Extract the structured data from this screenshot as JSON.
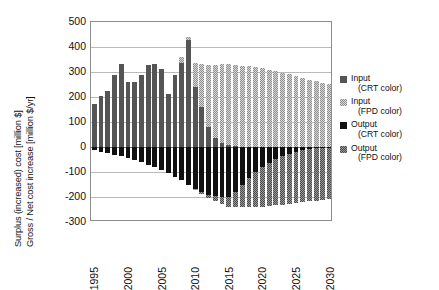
{
  "chart_data": {
    "type": "bar",
    "stacked": true,
    "title": "",
    "xlabel": "",
    "ylabel": "Surplus (increased) cost [million $]  /  Gross / Net cost increase [million $/yr]",
    "ylabel_lines": [
      "Surplus (increased) cost [million $]",
      "Gross / Net cost increase [million $/yr]"
    ],
    "ylim": [
      -300,
      500
    ],
    "yticks": [
      500,
      400,
      300,
      200,
      100,
      0,
      -100,
      -200,
      -300
    ],
    "xlim": [
      1995,
      2030
    ],
    "xticks": [
      1995,
      2000,
      2005,
      2010,
      2015,
      2020,
      2025,
      2030
    ],
    "grid": true,
    "legend_position": "right",
    "categories": [
      1995,
      1996,
      1997,
      1998,
      1999,
      2000,
      2001,
      2002,
      2003,
      2004,
      2005,
      2006,
      2007,
      2008,
      2009,
      2010,
      2011,
      2012,
      2013,
      2014,
      2015,
      2016,
      2017,
      2018,
      2019,
      2020,
      2021,
      2022,
      2023,
      2024,
      2025,
      2026,
      2027,
      2028,
      2029,
      2030
    ],
    "series": [
      {
        "name": "Input (CRT color)",
        "key": "input_crt",
        "color": "#555555",
        "pattern": "solid",
        "values": [
          172,
          205,
          226,
          288,
          333,
          262,
          261,
          290,
          327,
          334,
          314,
          212,
          288,
          335,
          430,
          240,
          160,
          80,
          36,
          16,
          8,
          4,
          2,
          1,
          0,
          0,
          0,
          0,
          0,
          0,
          0,
          0,
          0,
          0,
          0,
          0
        ]
      },
      {
        "name": "Input (FPD color)",
        "key": "input_fpd",
        "color": "#d8d8d8",
        "pattern": "dotted",
        "values": [
          0,
          0,
          0,
          0,
          0,
          0,
          0,
          0,
          0,
          0,
          0,
          0,
          0,
          25,
          10,
          95,
          173,
          250,
          293,
          316,
          325,
          326,
          324,
          322,
          319,
          315,
          310,
          304,
          298,
          291,
          284,
          277,
          270,
          264,
          258,
          252
        ]
      },
      {
        "name": "Output (CRT color)",
        "key": "output_crt",
        "color": "#111111",
        "pattern": "solid",
        "values": [
          -12,
          -18,
          -24,
          -30,
          -37,
          -44,
          -52,
          -60,
          -70,
          -80,
          -92,
          -104,
          -118,
          -133,
          -150,
          -166,
          -180,
          -190,
          -196,
          -199,
          -200,
          -178,
          -150,
          -124,
          -100,
          -80,
          -62,
          -48,
          -36,
          -26,
          -18,
          -12,
          -8,
          -5,
          -3,
          -2
        ]
      },
      {
        "name": "Output (FPD color)",
        "key": "output_fpd",
        "color": "#9a9a9a",
        "pattern": "dotted",
        "values": [
          0,
          0,
          0,
          0,
          0,
          0,
          0,
          0,
          0,
          0,
          0,
          0,
          0,
          0,
          0,
          -2,
          -6,
          -12,
          -20,
          -30,
          -40,
          -62,
          -90,
          -116,
          -140,
          -158,
          -173,
          -185,
          -194,
          -201,
          -206,
          -208,
          -209,
          -209,
          -208,
          -206
        ]
      }
    ]
  },
  "legend": {
    "items": [
      {
        "line1": "Input",
        "line2": "(CRT color)",
        "swatch": "input_crt"
      },
      {
        "line1": "Input",
        "line2": "(FPD color)",
        "swatch": "input_fpd"
      },
      {
        "line1": "Output",
        "line2": "(CRT color)",
        "swatch": "output_crt"
      },
      {
        "line1": "Output",
        "line2": "(FPD color)",
        "swatch": "output_fpd"
      }
    ]
  }
}
